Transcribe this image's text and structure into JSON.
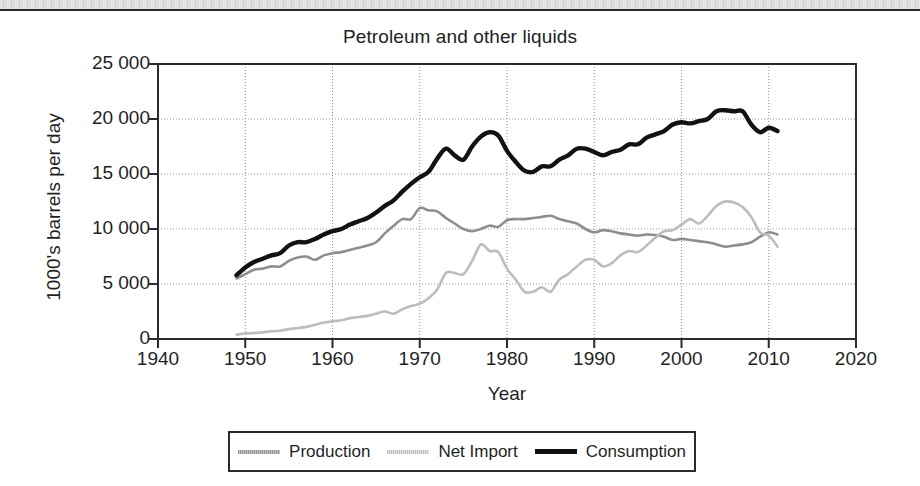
{
  "figure": {
    "scan_artifact": true,
    "background_color": "#ffffff"
  },
  "chart_data": {
    "type": "line",
    "title": "Petroleum and other liquids",
    "xlabel": "Year",
    "ylabel": "1000's barrels per day",
    "xlim": [
      1940,
      2020
    ],
    "ylim": [
      0,
      25000
    ],
    "xticks": [
      1940,
      1950,
      1960,
      1970,
      1980,
      1990,
      2000,
      2010,
      2020
    ],
    "xtick_labels": [
      "1940",
      "1950",
      "1960",
      "1970",
      "1980",
      "1990",
      "2000",
      "2010",
      "2020"
    ],
    "yticks": [
      0,
      5000,
      10000,
      15000,
      20000,
      25000
    ],
    "ytick_labels": [
      "0",
      "5 000",
      "10 000",
      "15 000",
      "20 000",
      "25 000"
    ],
    "grid": true,
    "grid_style": "dotted",
    "legend_position": "below-center",
    "x": [
      1949,
      1950,
      1951,
      1952,
      1953,
      1954,
      1955,
      1956,
      1957,
      1958,
      1959,
      1960,
      1961,
      1962,
      1963,
      1964,
      1965,
      1966,
      1967,
      1968,
      1969,
      1970,
      1971,
      1972,
      1973,
      1974,
      1975,
      1976,
      1977,
      1978,
      1979,
      1980,
      1981,
      1982,
      1983,
      1984,
      1985,
      1986,
      1987,
      1988,
      1989,
      1990,
      1991,
      1992,
      1993,
      1994,
      1995,
      1996,
      1997,
      1998,
      1999,
      2000,
      2001,
      2002,
      2003,
      2004,
      2005,
      2006,
      2007,
      2008,
      2009,
      2010,
      2011
    ],
    "series": [
      {
        "name": "Production",
        "color": "#8e8e8e",
        "style": "thin-gray",
        "values": [
          5500,
          5900,
          6300,
          6400,
          6600,
          6600,
          7100,
          7400,
          7500,
          7200,
          7600,
          7800,
          7900,
          8100,
          8300,
          8500,
          8800,
          9600,
          10300,
          10900,
          10900,
          11900,
          11700,
          11600,
          11000,
          10500,
          10000,
          9800,
          10000,
          10300,
          10200,
          10800,
          10900,
          10900,
          11000,
          11100,
          11200,
          10900,
          10700,
          10500,
          10000,
          9700,
          9900,
          9800,
          9600,
          9500,
          9400,
          9500,
          9450,
          9300,
          9000,
          9100,
          9000,
          8900,
          8800,
          8600,
          8400,
          8500,
          8600,
          8800,
          9300,
          9700,
          9500
        ],
        "key_points": [
          {
            "year": 1970,
            "value": 11900,
            "note": "peak"
          },
          {
            "year": 1976,
            "value": 9800,
            "note": "trough"
          },
          {
            "year": 1985,
            "value": 11200,
            "note": "secondary peak"
          },
          {
            "year": 2011,
            "value": 9500,
            "note": "end"
          }
        ]
      },
      {
        "name": "Net Import",
        "color": "#bdbdbd",
        "style": "thin-light-gray",
        "values": [
          400,
          500,
          550,
          600,
          700,
          750,
          900,
          1000,
          1100,
          1300,
          1500,
          1600,
          1700,
          1900,
          2000,
          2100,
          2300,
          2500,
          2300,
          2700,
          3000,
          3200,
          3700,
          4500,
          6000,
          6000,
          5900,
          7100,
          8600,
          8000,
          7900,
          6400,
          5400,
          4300,
          4300,
          4700,
          4300,
          5400,
          5900,
          6600,
          7200,
          7200,
          6600,
          6900,
          7600,
          8000,
          7900,
          8500,
          9200,
          9800,
          9900,
          10400,
          10900,
          10500,
          11200,
          12100,
          12500,
          12400,
          12000,
          11100,
          9700,
          9400,
          8400
        ],
        "key_points": [
          {
            "year": 1977,
            "value": 8600,
            "note": "peak"
          },
          {
            "year": 1983,
            "value": 4300,
            "note": "trough"
          },
          {
            "year": 2005,
            "value": 12500,
            "note": "peak"
          },
          {
            "year": 2011,
            "value": 8400,
            "note": "end"
          }
        ]
      },
      {
        "name": "Consumption",
        "color": "#121212",
        "style": "thick-black",
        "values": [
          5800,
          6500,
          7000,
          7300,
          7600,
          7800,
          8500,
          8800,
          8800,
          9100,
          9500,
          9800,
          10000,
          10400,
          10700,
          11000,
          11500,
          12100,
          12600,
          13400,
          14100,
          14700,
          15200,
          16400,
          17300,
          16700,
          16300,
          17500,
          18400,
          18800,
          18500,
          17100,
          16100,
          15300,
          15200,
          15700,
          15700,
          16300,
          16700,
          17300,
          17300,
          17000,
          16700,
          17000,
          17200,
          17700,
          17700,
          18300,
          18600,
          18900,
          19500,
          19700,
          19600,
          19800,
          20000,
          20700,
          20800,
          20700,
          20700,
          19500,
          18800,
          19200,
          18900
        ],
        "key_points": [
          {
            "year": 1978,
            "value": 18800,
            "note": "peak"
          },
          {
            "year": 1983,
            "value": 15200,
            "note": "trough"
          },
          {
            "year": 2005,
            "value": 20800,
            "note": "peak"
          },
          {
            "year": 2011,
            "value": 18900,
            "note": "end"
          }
        ]
      }
    ]
  },
  "legend": {
    "entries": [
      {
        "label": "Production",
        "swatch": "sw-production"
      },
      {
        "label": "Net Import",
        "swatch": "sw-netimport"
      },
      {
        "label": "Consumption",
        "swatch": "sw-consumption"
      }
    ]
  }
}
